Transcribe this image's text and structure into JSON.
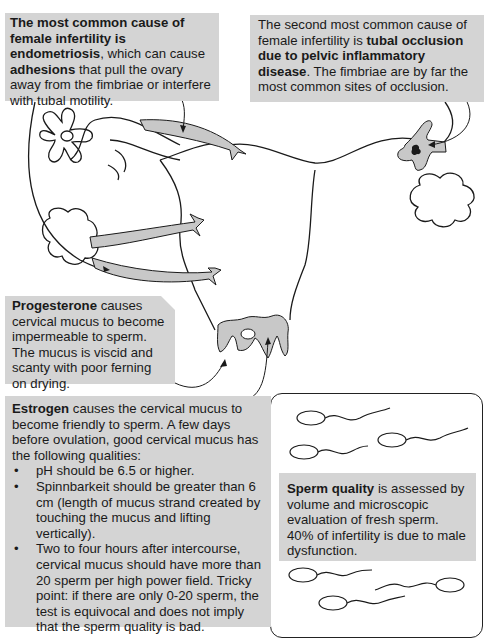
{
  "endometriosis_note": {
    "bold_intro": "The most common cause of female infertility is endometriosis",
    "text_a": ", which can cause ",
    "bold_term": "adhesions",
    "text_b": " that pull the ovary away from the fimbriae or interfere with tubal motility."
  },
  "tubal_note": {
    "text_a": "The second most common cause of female infertility is ",
    "bold_term": "tubal occlusion due to pelvic inflammatory disease",
    "text_b": ". The fimbriae are by far the most common sites of occlusion."
  },
  "progesterone_note": {
    "bold_term": "Progesterone",
    "text": " causes cervical mucus to become impermeable to sperm.  The mucus is viscid and scanty with poor ferning on drying."
  },
  "estrogen_note": {
    "bold_term": "Estrogen",
    "intro": " causes the cervical mucus to become friendly to sperm.  A few days before ovulation, good cervical mucus has the following qualities:",
    "bullets": [
      "pH should be 6.5 or higher.",
      "Spinnbarkeit should be greater than 6 cm (length of mucus strand created by touching the mucus and lifting vertically).",
      "Two to four hours after intercourse, cervical mucus should have more than 20 sperm per high power field.  Tricky point:  if there are only 0-20 sperm, the test is equivocal and does not imply that the sperm quality is bad."
    ]
  },
  "sperm_note": {
    "bold_term": "Sperm quality",
    "text": " is assessed by volume and microscopic evaluation of fresh sperm. 40% of infertility is due to male dysfunction."
  },
  "colors": {
    "callout_fill": "#d4d4d4",
    "shape_fill": "#c8c8c8",
    "stroke": "#1a1a1a"
  }
}
